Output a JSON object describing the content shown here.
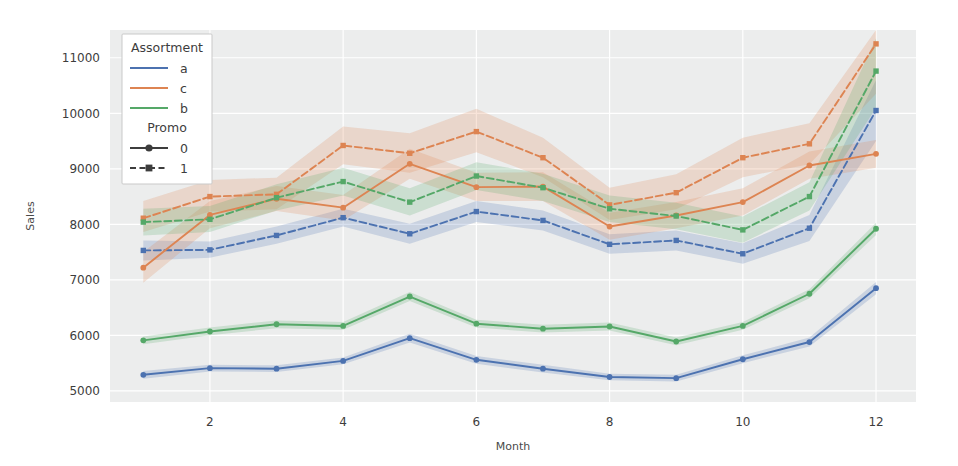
{
  "chart_data": {
    "type": "line",
    "title": "",
    "xlabel": "Month",
    "ylabel": "Sales",
    "x": [
      1,
      2,
      3,
      4,
      5,
      6,
      7,
      8,
      9,
      10,
      11,
      12
    ],
    "xticks": [
      2,
      4,
      6,
      8,
      10,
      12
    ],
    "yticks": [
      5000,
      6000,
      7000,
      8000,
      9000,
      10000,
      11000
    ],
    "xlim": [
      0.5,
      12.6
    ],
    "ylim": [
      4800,
      11500
    ],
    "grid": true,
    "legend_position": "upper left",
    "legends": [
      {
        "title": "Assortment",
        "entries": [
          {
            "label": "a",
            "color": "#4c72b0"
          },
          {
            "label": "c",
            "color": "#dd8452"
          },
          {
            "label": "b",
            "color": "#55a868"
          }
        ]
      },
      {
        "title": "Promo",
        "entries": [
          {
            "label": "0",
            "style": "solid",
            "marker": "circle"
          },
          {
            "label": "1",
            "style": "dashed",
            "marker": "square"
          }
        ]
      }
    ],
    "series": [
      {
        "name": "a-1",
        "assortment": "a",
        "promo": "1",
        "color": "#4c72b0",
        "style": "dashed",
        "marker": "square",
        "values": [
          7530,
          7540,
          7800,
          8120,
          7830,
          8230,
          8070,
          7640,
          7710,
          7470,
          7930,
          10050
        ],
        "band_low": [
          7350,
          7400,
          7650,
          7960,
          7650,
          8040,
          7890,
          7470,
          7530,
          7290,
          7700,
          9500
        ],
        "band_high": [
          7710,
          7690,
          7960,
          8280,
          8010,
          8420,
          8250,
          7820,
          7890,
          7660,
          8170,
          10600
        ]
      },
      {
        "name": "a-0",
        "assortment": "a",
        "promo": "0",
        "color": "#4c72b0",
        "style": "solid",
        "marker": "circle",
        "values": [
          5290,
          5410,
          5400,
          5540,
          5950,
          5560,
          5400,
          5250,
          5230,
          5570,
          5880,
          6850
        ],
        "band_low": [
          5220,
          5350,
          5340,
          5480,
          5870,
          5490,
          5330,
          5190,
          5170,
          5500,
          5800,
          6740
        ],
        "band_high": [
          5360,
          5470,
          5460,
          5600,
          6030,
          5630,
          5470,
          5310,
          5290,
          5640,
          5960,
          6960
        ]
      },
      {
        "name": "c-1",
        "assortment": "c",
        "promo": "1",
        "color": "#dd8452",
        "style": "dashed",
        "marker": "square",
        "values": [
          8110,
          8500,
          8540,
          9420,
          9280,
          9670,
          9200,
          8350,
          8570,
          9200,
          9450,
          11250
        ],
        "band_low": [
          7860,
          8230,
          8270,
          9080,
          8930,
          9300,
          8850,
          8080,
          8270,
          8850,
          9080,
          10350
        ],
        "band_high": [
          8420,
          8800,
          8840,
          9760,
          9640,
          10080,
          9560,
          8660,
          8900,
          9560,
          9820,
          11500
        ]
      },
      {
        "name": "c-0",
        "assortment": "c",
        "promo": "0",
        "color": "#dd8452",
        "style": "solid",
        "marker": "circle",
        "values": [
          7220,
          8170,
          8460,
          8300,
          9090,
          8670,
          8680,
          7960,
          8160,
          8400,
          9060,
          9270
        ],
        "band_low": [
          6950,
          7930,
          8240,
          8070,
          8820,
          8420,
          8420,
          7720,
          7930,
          8160,
          8820,
          9020
        ],
        "band_high": [
          7500,
          8420,
          8690,
          8530,
          9360,
          8930,
          8940,
          8210,
          8400,
          8650,
          9310,
          9520
        ]
      },
      {
        "name": "b-1",
        "assortment": "b",
        "promo": "1",
        "color": "#55a868",
        "style": "dashed",
        "marker": "square",
        "values": [
          8040,
          8090,
          8480,
          8770,
          8400,
          8870,
          8660,
          8280,
          8150,
          7900,
          8500,
          10760
        ],
        "band_low": [
          7800,
          7860,
          8250,
          8520,
          8160,
          8620,
          8420,
          8040,
          7910,
          7670,
          8250,
          10100
        ],
        "band_high": [
          8280,
          8330,
          8720,
          9020,
          8650,
          9120,
          8910,
          8520,
          8390,
          8140,
          8760,
          11350
        ]
      },
      {
        "name": "b-0",
        "assortment": "b",
        "promo": "0",
        "color": "#55a868",
        "style": "solid",
        "marker": "circle",
        "values": [
          5910,
          6070,
          6200,
          6170,
          6700,
          6210,
          6120,
          6160,
          5890,
          6170,
          6750,
          7920
        ],
        "band_low": [
          5840,
          6000,
          6130,
          6100,
          6620,
          6140,
          6050,
          6090,
          5820,
          6100,
          6670,
          7810
        ],
        "band_high": [
          5980,
          6140,
          6270,
          6240,
          6780,
          6280,
          6190,
          6230,
          5960,
          6240,
          6830,
          8030
        ]
      }
    ]
  },
  "figure": {
    "background": "#ffffff",
    "panel_background": "#eceded",
    "grid_color": "#ffffff"
  }
}
